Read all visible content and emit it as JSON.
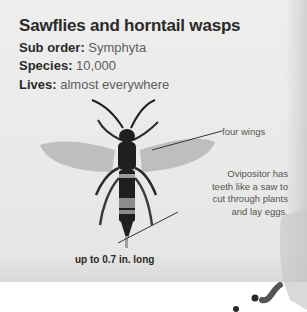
{
  "title": "Sawflies and horntail wasps",
  "facts": [
    {
      "label": "Sub order:",
      "value": "Symphyta"
    },
    {
      "label": "Species:",
      "value": "10,000"
    },
    {
      "label": "Lives:",
      "value": "almost everywhere"
    }
  ],
  "annotations": {
    "wings": "four wings",
    "ovipositor": [
      "Ovipositor has",
      "teeth like a saw to",
      "cut through plants",
      "and lay eggs."
    ],
    "size": "up to 0.7 in. long"
  },
  "illustration": {
    "subject": "horntail-wasp-icon",
    "colors": {
      "body": "#1f1f1f",
      "wing": "#b9b9b7",
      "stripe": "#8c8c8a",
      "paper": "#ebebea"
    }
  }
}
